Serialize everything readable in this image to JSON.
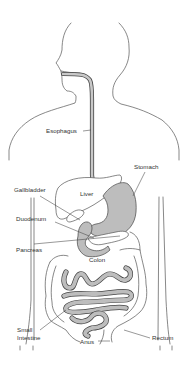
{
  "diagram": {
    "labels": {
      "esophagus": "Esophagus",
      "stomach": "Stomach",
      "gallbladder": "Gallbladder",
      "liver": "Liver",
      "duodenum": "Duodenum",
      "pancreas": "Pancreas",
      "colon": "Colon",
      "small_intestine_line1": "Small",
      "small_intestine_line2": "Intestine",
      "anus": "Anus",
      "rectum": "Rectum"
    },
    "colors": {
      "background": "#ffffff",
      "outline": "#555555",
      "organ_fill": "#bdbdbd",
      "text": "#333333"
    }
  }
}
